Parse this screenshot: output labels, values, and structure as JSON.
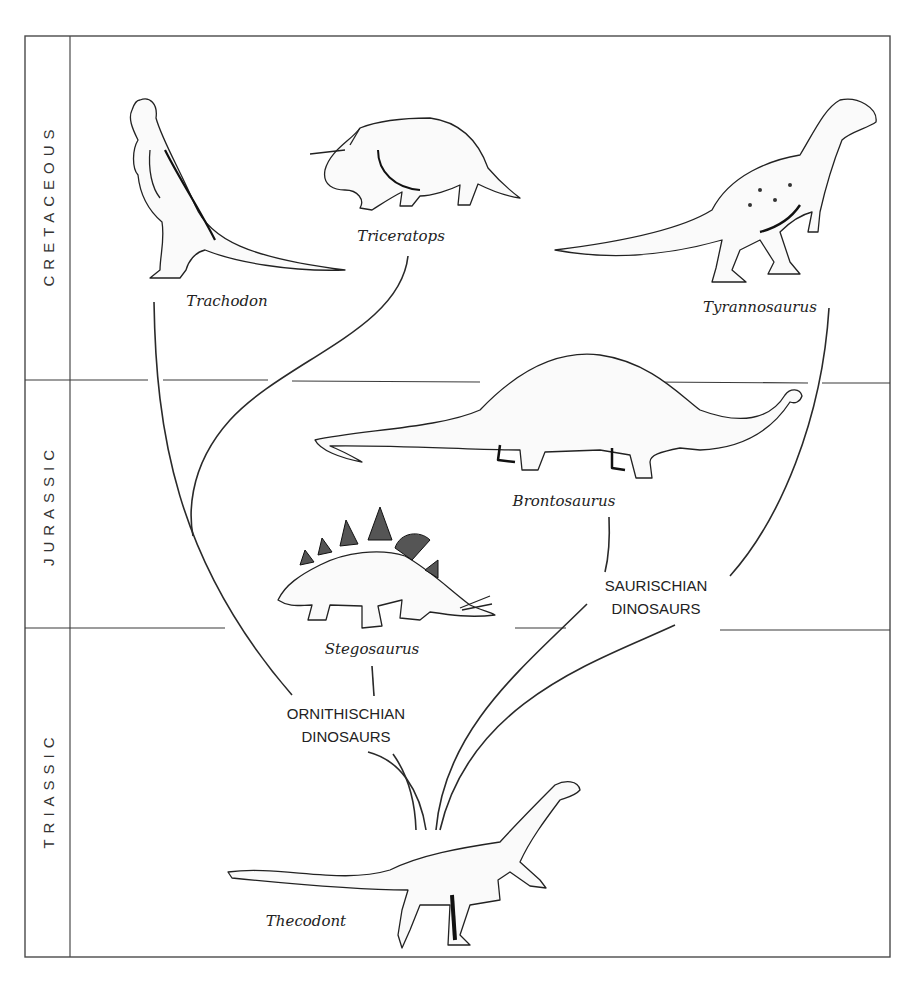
{
  "diagram": {
    "type": "evolutionary-tree",
    "periods": [
      {
        "name": "CRETACEOUS",
        "y_top": 38,
        "y_bottom": 380
      },
      {
        "name": "JURASSIC",
        "y_top": 380,
        "y_bottom": 628
      },
      {
        "name": "TRIASSIC",
        "y_top": 628,
        "y_bottom": 957
      }
    ],
    "species": [
      {
        "id": "trachodon",
        "name": "Trachodon",
        "period": "CRETACEOUS",
        "group": "ORNITHISCHIAN DINOSAURS"
      },
      {
        "id": "triceratops",
        "name": "Triceratops",
        "period": "CRETACEOUS",
        "group": "ORNITHISCHIAN DINOSAURS"
      },
      {
        "id": "tyrannosaurus",
        "name": "Tyrannosaurus",
        "period": "CRETACEOUS",
        "group": "SAURISCHIAN DINOSAURS"
      },
      {
        "id": "brontosaurus",
        "name": "Brontosaurus",
        "period": "JURASSIC",
        "group": "SAURISCHIAN DINOSAURS"
      },
      {
        "id": "stegosaurus",
        "name": "Stegosaurus",
        "period": "JURASSIC",
        "group": "ORNITHISCHIAN DINOSAURS"
      },
      {
        "id": "thecodont",
        "name": "Thecodont",
        "period": "TRIASSIC",
        "group": "ancestor"
      }
    ],
    "groups": [
      {
        "id": "ornithischian",
        "line1": "ORNITHISCHIAN",
        "line2": "DINOSAURS"
      },
      {
        "id": "saurischian",
        "line1": "SAURISCHIAN",
        "line2": "DINOSAURS"
      }
    ],
    "colors": {
      "ink": "#2a2a2a",
      "frame": "#555555",
      "background": "#ffffff"
    }
  }
}
